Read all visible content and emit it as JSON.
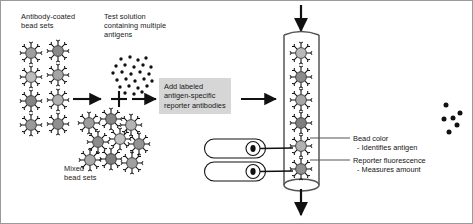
{
  "figure": {
    "type": "diagram",
    "background_color": "#ffffff",
    "border_color": "#9a9a9a"
  },
  "labels": {
    "antibody_coated_beads": "Antibody-coated\nbead sets",
    "test_solution": "Test solution\ncontaining multiple\nantigens",
    "mixed_bead_sets": "Mixed\nbead sets",
    "process_box": "Add labeled\nantigen-specific\nreporter antibodies",
    "laser_one": "LASER",
    "laser_two": "LASER",
    "bead_color_title": "Bead color",
    "bead_color_sub": "- Identifies antigen",
    "reporter_title": "Reporter fluorescence",
    "reporter_sub": "- Measures amount"
  },
  "colors": {
    "process_box_fill": "#d6d6d6",
    "stroke": "#1a1a1a",
    "tube_stroke": "#4a4a4a",
    "dot_fill": "#111111",
    "bead_shades": [
      "#9a9a9a",
      "#b5b5b5",
      "#7d7d7d",
      "#c6c6c6",
      "#8d8d8d",
      "#a8a8a8"
    ]
  },
  "bead_sets": {
    "count": 8,
    "positions": [
      {
        "x": 30,
        "y": 52,
        "shade": "#9f9f9f"
      },
      {
        "x": 57,
        "y": 50,
        "shade": "#8a8a8a"
      },
      {
        "x": 30,
        "y": 76,
        "shade": "#bdbdbd"
      },
      {
        "x": 57,
        "y": 74,
        "shade": "#a4a4a4"
      },
      {
        "x": 30,
        "y": 100,
        "shade": "#858585"
      },
      {
        "x": 57,
        "y": 99,
        "shade": "#b0b0b0"
      },
      {
        "x": 30,
        "y": 124,
        "shade": "#9a9a9a"
      },
      {
        "x": 57,
        "y": 123,
        "shade": "#8f8f8f"
      }
    ]
  },
  "antigen_cloud": {
    "dot_count": 26,
    "description": "cloud of small black antigen dots"
  },
  "mixed_beads": {
    "count": 9,
    "description": "clustered mixed bead sets after incubation"
  },
  "flow_tube": {
    "beads_in_tube": 6,
    "inlet_arrow": "down",
    "outlet_arrow": "down",
    "description": "vertical flow cytometer capillary with single-file beads"
  },
  "output_dots": {
    "count": 6,
    "description": "detected signal dots at right edge"
  },
  "icons": {
    "plus": "+",
    "arrow_right": "→",
    "arrow_down": "↓"
  }
}
